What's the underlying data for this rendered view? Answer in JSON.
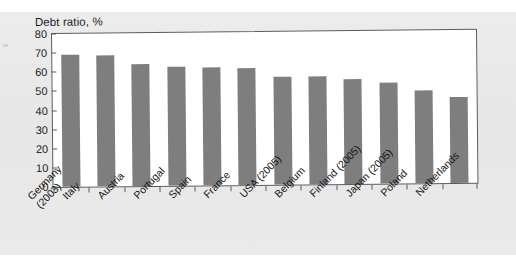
{
  "figure": {
    "title": "Debt ratio, %"
  },
  "chart_data": {
    "type": "bar",
    "title": "Debt ratio, %",
    "xlabel": "",
    "ylabel": "Debt ratio, %",
    "ylim": [
      0,
      80
    ],
    "yticks": [
      0,
      10,
      20,
      30,
      40,
      50,
      60,
      70,
      80
    ],
    "grid": false,
    "legend": null,
    "bar_color": "#7e7e7e",
    "categories": [
      "Germany\n(2003)",
      "Italy",
      "Austria",
      "Portugal",
      "Spain",
      "France",
      "USA (2005)",
      "Belgium",
      "Finland (2005)",
      "Japan (2005)",
      "Poland",
      "Netherlands"
    ],
    "values": [
      69,
      68.5,
      64,
      62,
      61.5,
      61,
      56.5,
      56.5,
      55,
      53,
      48.5,
      45
    ]
  }
}
